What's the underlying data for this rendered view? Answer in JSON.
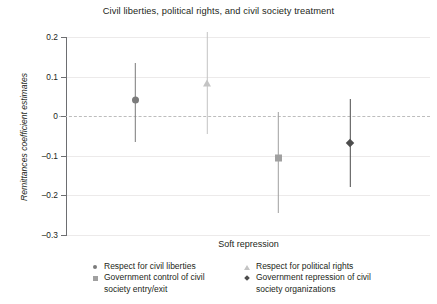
{
  "chart_data": {
    "type": "scatter",
    "title": "Civil liberties, political rights, and civil society treatment",
    "xlabel": "Soft repression",
    "ylabel": "Remittances coefficient estimates",
    "ylim": [
      -0.3,
      0.2
    ],
    "yticks": [
      0.2,
      0.1,
      0,
      -0.1,
      -0.2,
      -0.3
    ],
    "ytick_labels": [
      "0.2",
      "0.1",
      "0",
      "–0.1",
      "–0.2",
      "–0.3"
    ],
    "grid": true,
    "zero_reference_line": 0,
    "legend_position": "bottom",
    "series": [
      {
        "name": "Respect for civil liberties",
        "marker": "circle",
        "color": "#7b7b7b",
        "estimate": 0.04,
        "ci_low": -0.065,
        "ci_high": 0.135
      },
      {
        "name": "Respect for political rights",
        "marker": "triangle",
        "color": "#c4c4c4",
        "estimate": 0.085,
        "ci_low": -0.045,
        "ci_high": 0.213
      },
      {
        "name": "Government control of civil society entry/exit",
        "marker": "square",
        "color": "#a0a0a0",
        "estimate": -0.105,
        "ci_low": -0.245,
        "ci_high": 0.01
      },
      {
        "name": "Government repression of civil society organizations",
        "marker": "diamond",
        "color": "#4d4d4d",
        "estimate": -0.067,
        "ci_low": -0.18,
        "ci_high": 0.043
      }
    ]
  },
  "legend": {
    "items": [
      {
        "label": "Respect for civil liberties",
        "label_line2": ""
      },
      {
        "label": "Respect for political rights",
        "label_line2": ""
      },
      {
        "label": "Government control of civil",
        "label_line2": "society entry/exit"
      },
      {
        "label": "Government repression of civil",
        "label_line2": "society organizations"
      }
    ]
  },
  "colors": {
    "axis": "#6d6e71",
    "grid": "#eceaea",
    "zero_line": "#bdbdbd",
    "text": "#231f20"
  }
}
